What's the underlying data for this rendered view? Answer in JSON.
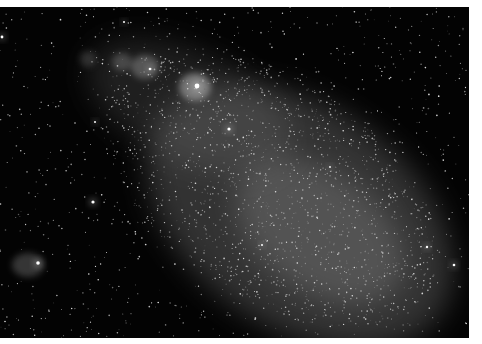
{
  "image": {
    "subject": "dwarf galaxy star field",
    "background_color": "#030303",
    "border_color": "#ffffff",
    "glows": [
      {
        "name": "galaxy-body",
        "cx": 300,
        "cy": 210,
        "rx": 170,
        "ry": 110,
        "rot": 35,
        "color": "rgba(150,150,150,0.32)"
      },
      {
        "name": "galaxy-core",
        "cx": 320,
        "cy": 225,
        "rx": 95,
        "ry": 60,
        "rot": 35,
        "color": "rgba(170,170,170,0.28)"
      },
      {
        "name": "upper-arm",
        "cx": 190,
        "cy": 100,
        "rx": 110,
        "ry": 55,
        "rot": 25,
        "color": "rgba(130,130,130,0.22)"
      },
      {
        "name": "nebula-1",
        "cx": 195,
        "cy": 80,
        "rx": 16,
        "ry": 14,
        "rot": 0,
        "color": "rgba(210,210,210,0.45)"
      },
      {
        "name": "nebula-2",
        "cx": 145,
        "cy": 60,
        "rx": 14,
        "ry": 12,
        "rot": 0,
        "color": "rgba(190,190,190,0.35)"
      },
      {
        "name": "nebula-3",
        "cx": 122,
        "cy": 55,
        "rx": 10,
        "ry": 9,
        "rot": 0,
        "color": "rgba(170,170,170,0.3)"
      },
      {
        "name": "nebula-4",
        "cx": 88,
        "cy": 52,
        "rx": 8,
        "ry": 8,
        "rot": 0,
        "color": "rgba(150,150,150,0.25)"
      },
      {
        "name": "cluster-bottom-left",
        "cx": 28,
        "cy": 258,
        "rx": 16,
        "ry": 12,
        "rot": 0,
        "color": "rgba(170,170,170,0.3)"
      }
    ],
    "bright_stars": [
      {
        "x": 197,
        "y": 79,
        "r": 2.4
      },
      {
        "x": 229,
        "y": 122,
        "r": 1.6
      },
      {
        "x": 93,
        "y": 195,
        "r": 1.6
      },
      {
        "x": 38,
        "y": 256,
        "r": 1.8
      },
      {
        "x": 150,
        "y": 62,
        "r": 1.3
      },
      {
        "x": 124,
        "y": 15,
        "r": 1.0
      },
      {
        "x": 454,
        "y": 258,
        "r": 1.3
      },
      {
        "x": 427,
        "y": 240,
        "r": 1.2
      },
      {
        "x": 2,
        "y": 30,
        "r": 1.4
      },
      {
        "x": 95,
        "y": 115,
        "r": 1.0
      },
      {
        "x": 262,
        "y": 238,
        "r": 1.0
      },
      {
        "x": 330,
        "y": 160,
        "r": 0.9
      }
    ],
    "seed": 7,
    "star_count": 2600
  }
}
